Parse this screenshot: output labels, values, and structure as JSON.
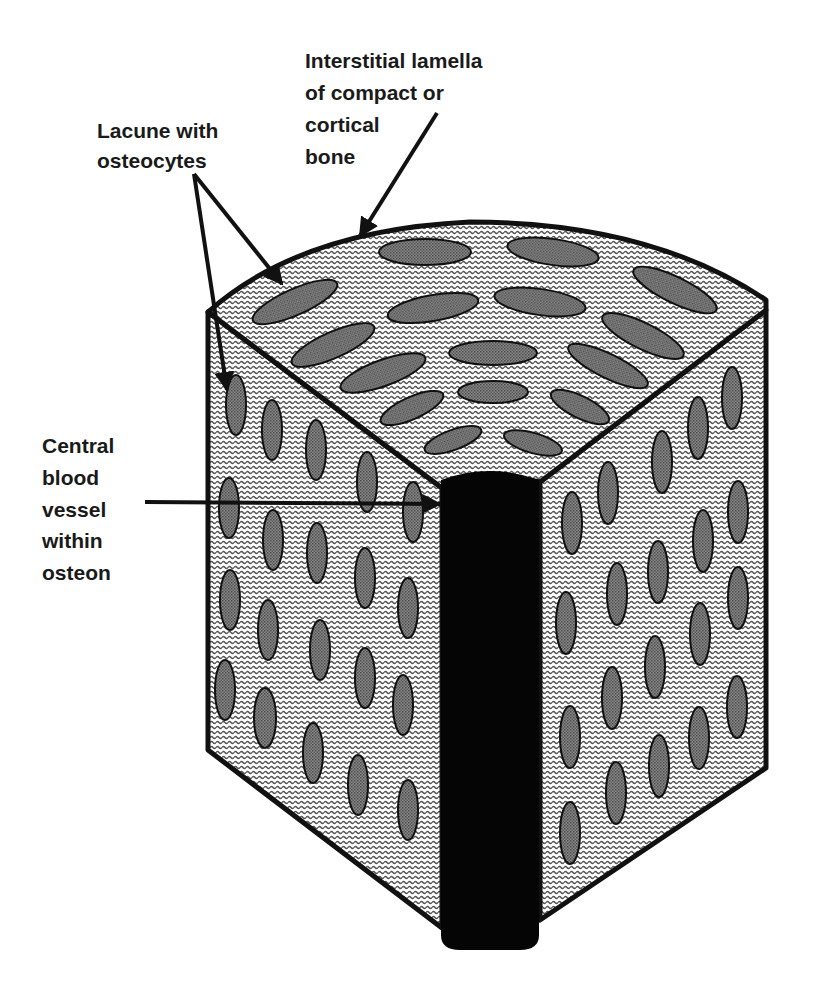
{
  "figure": {
    "colors": {
      "background": "#ffffff",
      "outline": "#111111",
      "matrix_wave": "#555555",
      "lacuna_fill": "#7a7a7a",
      "central_canal": "#050505"
    }
  },
  "labels": {
    "interstitial": {
      "lines": [
        "Interstitial lamella",
        "of compact or",
        "cortical",
        "bone"
      ]
    },
    "lacune": {
      "lines": [
        "Lacune with",
        "osteocytes"
      ]
    },
    "central": {
      "lines": [
        "Central",
        "blood",
        "vessel",
        "within",
        "osteon"
      ]
    }
  },
  "parts": {
    "top_face": {
      "lacunae": [
        {
          "cx": 425,
          "cy": 252,
          "rx": 46,
          "ry": 13,
          "rot": 0
        },
        {
          "cx": 553,
          "cy": 252,
          "rx": 46,
          "ry": 13,
          "rot": 8
        },
        {
          "cx": 675,
          "cy": 290,
          "rx": 46,
          "ry": 13,
          "rot": 26
        },
        {
          "cx": 295,
          "cy": 302,
          "rx": 46,
          "ry": 13,
          "rot": -24
        },
        {
          "cx": 433,
          "cy": 308,
          "rx": 46,
          "ry": 13,
          "rot": -10
        },
        {
          "cx": 540,
          "cy": 302,
          "rx": 46,
          "ry": 13,
          "rot": 8
        },
        {
          "cx": 643,
          "cy": 336,
          "rx": 45,
          "ry": 13,
          "rot": 26
        },
        {
          "cx": 333,
          "cy": 345,
          "rx": 45,
          "ry": 13,
          "rot": -24
        },
        {
          "cx": 493,
          "cy": 353,
          "rx": 44,
          "ry": 12,
          "rot": 0
        },
        {
          "cx": 608,
          "cy": 366,
          "rx": 44,
          "ry": 12,
          "rot": 26
        },
        {
          "cx": 383,
          "cy": 373,
          "rx": 45,
          "ry": 13,
          "rot": -20
        },
        {
          "cx": 493,
          "cy": 392,
          "rx": 35,
          "ry": 11,
          "rot": 0
        },
        {
          "cx": 412,
          "cy": 408,
          "rx": 34,
          "ry": 11,
          "rot": -24
        },
        {
          "cx": 580,
          "cy": 407,
          "rx": 32,
          "ry": 11,
          "rot": 26
        },
        {
          "cx": 453,
          "cy": 440,
          "rx": 30,
          "ry": 10,
          "rot": -20
        },
        {
          "cx": 533,
          "cy": 443,
          "rx": 30,
          "ry": 10,
          "rot": 16
        }
      ]
    },
    "left_face": {
      "lacunae": [
        {
          "cx": 236,
          "cy": 405,
          "rx": 10,
          "ry": 30
        },
        {
          "cx": 272,
          "cy": 430,
          "rx": 10,
          "ry": 30
        },
        {
          "cx": 316,
          "cy": 450,
          "rx": 10,
          "ry": 30
        },
        {
          "cx": 367,
          "cy": 482,
          "rx": 10,
          "ry": 30
        },
        {
          "cx": 229,
          "cy": 508,
          "rx": 10,
          "ry": 30
        },
        {
          "cx": 413,
          "cy": 512,
          "rx": 10,
          "ry": 30
        },
        {
          "cx": 273,
          "cy": 540,
          "rx": 10,
          "ry": 30
        },
        {
          "cx": 317,
          "cy": 553,
          "rx": 10,
          "ry": 30
        },
        {
          "cx": 365,
          "cy": 578,
          "rx": 10,
          "ry": 30
        },
        {
          "cx": 230,
          "cy": 600,
          "rx": 10,
          "ry": 30
        },
        {
          "cx": 408,
          "cy": 608,
          "rx": 10,
          "ry": 30
        },
        {
          "cx": 268,
          "cy": 630,
          "rx": 10,
          "ry": 30
        },
        {
          "cx": 320,
          "cy": 650,
          "rx": 10,
          "ry": 30
        },
        {
          "cx": 365,
          "cy": 678,
          "rx": 10,
          "ry": 30
        },
        {
          "cx": 225,
          "cy": 690,
          "rx": 10,
          "ry": 30
        },
        {
          "cx": 403,
          "cy": 705,
          "rx": 10,
          "ry": 30
        },
        {
          "cx": 265,
          "cy": 718,
          "rx": 11,
          "ry": 30
        },
        {
          "cx": 313,
          "cy": 753,
          "rx": 10,
          "ry": 30
        },
        {
          "cx": 358,
          "cy": 785,
          "rx": 10,
          "ry": 30
        },
        {
          "cx": 408,
          "cy": 810,
          "rx": 10,
          "ry": 30
        }
      ]
    },
    "right_face": {
      "lacunae": [
        {
          "cx": 732,
          "cy": 398,
          "rx": 10,
          "ry": 31
        },
        {
          "cx": 698,
          "cy": 428,
          "rx": 10,
          "ry": 31
        },
        {
          "cx": 662,
          "cy": 462,
          "rx": 10,
          "ry": 31
        },
        {
          "cx": 608,
          "cy": 493,
          "rx": 10,
          "ry": 31
        },
        {
          "cx": 738,
          "cy": 512,
          "rx": 10,
          "ry": 31
        },
        {
          "cx": 572,
          "cy": 523,
          "rx": 10,
          "ry": 31
        },
        {
          "cx": 703,
          "cy": 541,
          "rx": 10,
          "ry": 31
        },
        {
          "cx": 658,
          "cy": 572,
          "rx": 10,
          "ry": 31
        },
        {
          "cx": 738,
          "cy": 598,
          "rx": 10,
          "ry": 31
        },
        {
          "cx": 617,
          "cy": 594,
          "rx": 10,
          "ry": 31
        },
        {
          "cx": 566,
          "cy": 623,
          "rx": 10,
          "ry": 31
        },
        {
          "cx": 700,
          "cy": 634,
          "rx": 10,
          "ry": 31
        },
        {
          "cx": 655,
          "cy": 667,
          "rx": 10,
          "ry": 31
        },
        {
          "cx": 612,
          "cy": 698,
          "rx": 10,
          "ry": 31
        },
        {
          "cx": 737,
          "cy": 707,
          "rx": 10,
          "ry": 31
        },
        {
          "cx": 570,
          "cy": 737,
          "rx": 10,
          "ry": 31
        },
        {
          "cx": 699,
          "cy": 738,
          "rx": 10,
          "ry": 31
        },
        {
          "cx": 659,
          "cy": 766,
          "rx": 10,
          "ry": 31
        },
        {
          "cx": 616,
          "cy": 793,
          "rx": 10,
          "ry": 31
        },
        {
          "cx": 570,
          "cy": 833,
          "rx": 10,
          "ry": 31
        }
      ]
    }
  }
}
